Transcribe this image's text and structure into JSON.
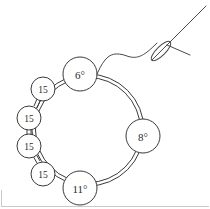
{
  "figure": {
    "background_color": "#ffffff",
    "ink_color": "#3a3a3a",
    "label_color": "#2b2b2b",
    "frame_color": "#c9c9c9"
  },
  "ring": {
    "description": "closed double-line loop forming a beaded ring",
    "center_x": 88,
    "center_y": 130,
    "radius": 55
  },
  "beads": [
    {
      "id": "bead-top",
      "label": "6°",
      "size_class": "large",
      "cx": 80,
      "cy": 74,
      "r": 17,
      "label_x": 80,
      "label_y": 75
    },
    {
      "id": "bead-right",
      "label": "8°",
      "size_class": "large",
      "cx": 143,
      "cy": 136,
      "r": 17,
      "label_x": 143,
      "label_y": 137
    },
    {
      "id": "bead-bottom",
      "label": "11°",
      "size_class": "large",
      "cx": 80,
      "cy": 188,
      "r": 17,
      "label_x": 80,
      "label_y": 189
    },
    {
      "id": "bead-small-1",
      "label": "15",
      "size_class": "small",
      "cx": 43,
      "cy": 89,
      "r": 12,
      "label_x": 43,
      "label_y": 90
    },
    {
      "id": "bead-small-2",
      "label": "15",
      "size_class": "small",
      "cx": 29,
      "cy": 118,
      "r": 12,
      "label_x": 29,
      "label_y": 119
    },
    {
      "id": "bead-small-3",
      "label": "15",
      "size_class": "small",
      "cx": 29,
      "cy": 146,
      "r": 12,
      "label_x": 29,
      "label_y": 147
    },
    {
      "id": "bead-small-4",
      "label": "15",
      "size_class": "small",
      "cx": 43,
      "cy": 174,
      "r": 12,
      "label_x": 43,
      "label_y": 175
    }
  ],
  "connectors": [
    {
      "id": "connector-1-2",
      "x1": 36,
      "y1": 100,
      "x2": 34,
      "y2": 107
    },
    {
      "id": "connector-2-3",
      "x1": 29,
      "y1": 130,
      "x2": 29,
      "y2": 134
    },
    {
      "id": "connector-3-4",
      "x1": 34,
      "y1": 157,
      "x2": 37,
      "y2": 163
    }
  ],
  "needle": {
    "id": "sewing-needle",
    "tip_x": 206,
    "tip_y": 6,
    "heel_x": 148,
    "heel_y": 63,
    "eye_center_x": 161,
    "eye_center_y": 50,
    "eye_length": 26,
    "eye_width": 9,
    "eye_angle_deg": -45
  },
  "thread": {
    "id": "thread-strand",
    "description": "S-curved thread running from the needle eye to the top bead",
    "path": "M 155 44 C 142 57 136 60 126 56 C 115 52 110 54 105 60 C 101 65 99 70 97 74"
  }
}
